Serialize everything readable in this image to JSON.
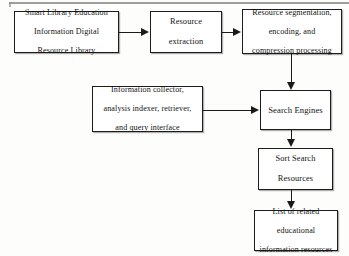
{
  "diagram": {
    "type": "flowchart",
    "title": "",
    "background_color": "#fdfdfc",
    "line_color": "#1a1a1a",
    "box_fill_color": "#ffffff",
    "nodes": [
      {
        "id": "source-library",
        "label": "Smart Library Education Information Digital Resource Library",
        "lines": [
          "Smart Library Education",
          "Information Digital",
          "Resource Library"
        ]
      },
      {
        "id": "resource-extraction",
        "label": "Resource extraction",
        "lines": [
          "Resource",
          "extraction"
        ]
      },
      {
        "id": "segmentation-encoding",
        "label": "Resource segmentation, encoding, and compression processing",
        "lines": [
          "Resource segmentation,",
          "encoding, and",
          "compression processing"
        ]
      },
      {
        "id": "information-collector",
        "label": "Information collector, analysis indexer, retriever, and query interface",
        "lines": [
          "Information collector,",
          "analysis indexer, retriever,",
          "and query interface"
        ]
      },
      {
        "id": "search-engines",
        "label": "Search Engines",
        "lines": [
          "Search Engines"
        ]
      },
      {
        "id": "sort-search-resources",
        "label": "Sort Search Resources",
        "lines": [
          "Sort Search",
          "Resources"
        ]
      },
      {
        "id": "result-list",
        "label": "List of related educational information resources",
        "lines": [
          "List of related",
          "educational",
          "information resources"
        ]
      }
    ],
    "edges": [
      {
        "from": "source-library",
        "to": "resource-extraction",
        "direction": "right"
      },
      {
        "from": "resource-extraction",
        "to": "segmentation-encoding",
        "direction": "right"
      },
      {
        "from": "segmentation-encoding",
        "to": "search-engines",
        "direction": "down"
      },
      {
        "from": "information-collector",
        "to": "search-engines",
        "direction": "right"
      },
      {
        "from": "search-engines",
        "to": "sort-search-resources",
        "direction": "down"
      },
      {
        "from": "sort-search-resources",
        "to": "result-list",
        "direction": "down"
      }
    ]
  }
}
